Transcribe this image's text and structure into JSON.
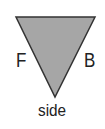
{
  "diagram": {
    "shape": "inverted-triangle",
    "fill_color": "#a6a6a6",
    "stroke_color": "#333333",
    "labels": {
      "left": "F",
      "right": "B",
      "bottom": "side"
    }
  }
}
